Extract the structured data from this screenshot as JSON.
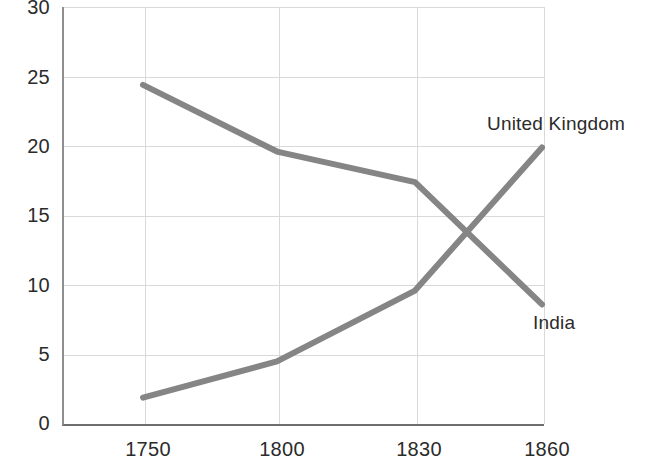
{
  "chart_data": {
    "type": "line",
    "title": "",
    "subtitle": "",
    "xlabel": "",
    "ylabel": "",
    "categories": [
      "1750",
      "1800",
      "1830",
      "1860"
    ],
    "x": [
      1750,
      1800,
      1830,
      1860
    ],
    "series": [
      {
        "name": "India",
        "values": [
          24.4,
          19.6,
          17.4,
          8.6
        ],
        "color": "#858585",
        "label_text": "India",
        "label_x_px": 533,
        "label_y_px": 312
      },
      {
        "name": "United Kingdom",
        "values": [
          1.9,
          4.5,
          9.6,
          19.9
        ],
        "color": "#858585",
        "label_text": "United Kingdom",
        "label_x_px": 487,
        "label_y_px": 113
      }
    ],
    "ylim": [
      0,
      30
    ],
    "yticks": [
      0,
      5,
      10,
      15,
      20,
      25,
      30
    ],
    "ytick_labels": [
      "0",
      "5",
      "10",
      "15",
      "20",
      "25",
      "30"
    ],
    "xtick_labels": [
      "1750",
      "1800",
      "1830",
      "1860"
    ],
    "grid": true,
    "grid_horizontal": true,
    "grid_vertical": true,
    "legend": "inline-series-labels",
    "legend_position": "right-of-line-endpoints",
    "colors": {
      "line": "#858585",
      "grid": "#d9d9d9",
      "axis": "#7a7a7a",
      "text": "#2b2b2b",
      "background": "#ffffff"
    }
  },
  "axes": {
    "plot": {
      "left_px": 62,
      "top_px": 7,
      "width_px": 480,
      "height_px": 417
    },
    "x_positions_px": [
      143,
      277,
      415,
      542
    ],
    "y_positions_px": [
      424,
      354,
      285,
      216,
      146,
      77,
      7
    ]
  }
}
